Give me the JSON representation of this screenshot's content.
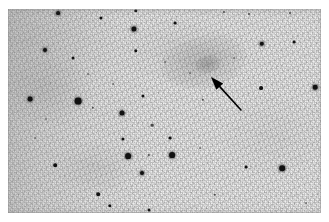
{
  "image": {
    "kind": "astronomical-photograph",
    "description": "Negative-style wide-field sky photograph showing a star field with a faint diffuse galaxy marked by an arrow",
    "frame": {
      "x": 8,
      "y": 9,
      "width": 313,
      "height": 204
    },
    "background_color": "#efefef",
    "star_color": "#111111",
    "arrow_color": "#000000"
  },
  "annotation": {
    "arrow": {
      "name": "pointer-arrow",
      "tip_x": 211,
      "tip_y": 77,
      "tail_x": 241,
      "tail_y": 110,
      "direction": "up-left",
      "points_to": "diffuse-galaxy"
    }
  },
  "galaxy": {
    "name": "diffuse-galaxy",
    "center_x": 204,
    "center_y": 62,
    "width": 86,
    "height": 52,
    "rotation_deg": -12,
    "peak_opacity": 0.22,
    "core_x": 208,
    "core_y": 64
  },
  "stars": [
    {
      "x": 58,
      "y": 13,
      "r": 1.9,
      "class": "soft"
    },
    {
      "x": 101,
      "y": 18,
      "r": 1.6,
      "class": ""
    },
    {
      "x": 136,
      "y": 11,
      "r": 1.7,
      "class": ""
    },
    {
      "x": 134,
      "y": 29,
      "r": 2.6,
      "class": "soft"
    },
    {
      "x": 175,
      "y": 23,
      "r": 1.4,
      "class": ""
    },
    {
      "x": 224,
      "y": 12,
      "r": 1.1,
      "class": "faint"
    },
    {
      "x": 249,
      "y": 14,
      "r": 1.0,
      "class": "faint"
    },
    {
      "x": 290,
      "y": 13,
      "r": 1.0,
      "class": "faint"
    },
    {
      "x": 45,
      "y": 50,
      "r": 2.0,
      "class": "soft"
    },
    {
      "x": 73,
      "y": 58,
      "r": 1.5,
      "class": ""
    },
    {
      "x": 136,
      "y": 51,
      "r": 1.7,
      "class": ""
    },
    {
      "x": 262,
      "y": 44,
      "r": 2.2,
      "class": "soft"
    },
    {
      "x": 294,
      "y": 42,
      "r": 1.4,
      "class": ""
    },
    {
      "x": 30,
      "y": 99,
      "r": 2.4,
      "class": "soft"
    },
    {
      "x": 78,
      "y": 101,
      "r": 3.4,
      "class": "soft"
    },
    {
      "x": 93,
      "y": 108,
      "r": 1.2,
      "class": "faint"
    },
    {
      "x": 143,
      "y": 96,
      "r": 1.6,
      "class": ""
    },
    {
      "x": 122,
      "y": 113,
      "r": 2.5,
      "class": "soft"
    },
    {
      "x": 152,
      "y": 125,
      "r": 1.3,
      "class": "faint"
    },
    {
      "x": 203,
      "y": 100,
      "r": 1.2,
      "class": "faint"
    },
    {
      "x": 261,
      "y": 88,
      "r": 1.9,
      "class": ""
    },
    {
      "x": 315,
      "y": 87,
      "r": 2.3,
      "class": "soft"
    },
    {
      "x": 46,
      "y": 119,
      "r": 1.0,
      "class": "vfaint"
    },
    {
      "x": 123,
      "y": 139,
      "r": 1.6,
      "class": ""
    },
    {
      "x": 170,
      "y": 138,
      "r": 1.4,
      "class": ""
    },
    {
      "x": 55,
      "y": 165,
      "r": 1.8,
      "class": ""
    },
    {
      "x": 128,
      "y": 156,
      "r": 2.9,
      "class": "soft"
    },
    {
      "x": 149,
      "y": 155,
      "r": 1.1,
      "class": "faint"
    },
    {
      "x": 172,
      "y": 155,
      "r": 2.9,
      "class": "soft"
    },
    {
      "x": 142,
      "y": 173,
      "r": 2.0,
      "class": "soft"
    },
    {
      "x": 246,
      "y": 167,
      "r": 1.4,
      "class": ""
    },
    {
      "x": 282,
      "y": 168,
      "r": 2.8,
      "class": "soft"
    },
    {
      "x": 98,
      "y": 194,
      "r": 1.8,
      "class": ""
    },
    {
      "x": 110,
      "y": 206,
      "r": 1.7,
      "class": ""
    },
    {
      "x": 215,
      "y": 195,
      "r": 1.2,
      "class": "faint"
    },
    {
      "x": 149,
      "y": 210,
      "r": 1.5,
      "class": ""
    },
    {
      "x": 306,
      "y": 203,
      "r": 0.9,
      "class": "vfaint"
    },
    {
      "x": 190,
      "y": 73,
      "r": 0.9,
      "class": "vfaint"
    },
    {
      "x": 165,
      "y": 62,
      "r": 0.9,
      "class": "vfaint"
    },
    {
      "x": 234,
      "y": 58,
      "r": 0.9,
      "class": "vfaint"
    },
    {
      "x": 35,
      "y": 138,
      "r": 0.9,
      "class": "vfaint"
    },
    {
      "x": 200,
      "y": 148,
      "r": 0.9,
      "class": "vfaint"
    },
    {
      "x": 88,
      "y": 74,
      "r": 0.9,
      "class": "vfaint"
    },
    {
      "x": 113,
      "y": 84,
      "r": 0.9,
      "class": "vfaint"
    }
  ]
}
